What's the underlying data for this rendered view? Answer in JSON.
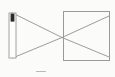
{
  "figure": {
    "background_color": "#fbfbfa",
    "width": 115,
    "height": 77,
    "line_color": "#8a8a8a",
    "box_line_color": "#9a9a9a",
    "object_body_color": "#fdfdfd",
    "object_outline_color": "#8d8d8d",
    "object_tip_color": "#2a2a2a",
    "caption_stub_color": "#b9b9b9"
  },
  "object_source": {
    "name": "candle",
    "x": 9,
    "y": 13,
    "width": 7,
    "height": 45,
    "tip_height": 8,
    "top_point_x": 12.5,
    "top_point_y": 13,
    "bottom_point_x": 12.5,
    "bottom_point_y": 58
  },
  "pinhole": {
    "name": "pinhole aperture",
    "x": 62,
    "y": 37.5
  },
  "screen_box": {
    "name": "image screen box",
    "x": 63.5,
    "y": 11.5,
    "width": 46,
    "height": 49,
    "right_x": 109.5,
    "bottom_y": 60.5,
    "fill": "#ffffff"
  },
  "rays": [
    {
      "name": "ray-top-to-bottom",
      "from_x": 12.5,
      "from_y": 13,
      "through_x": 62,
      "through_y": 37.5,
      "to_x": 109,
      "to_y": 57
    },
    {
      "name": "ray-bottom-to-top",
      "from_x": 12.5,
      "from_y": 58,
      "through_x": 62,
      "through_y": 37.5,
      "to_x": 109,
      "to_y": 16
    }
  ],
  "chart_data": {
    "type": "diagram",
    "elements": [
      {
        "label": "candle (object)",
        "x": 12.5,
        "y": 35.5
      },
      {
        "label": "pinhole",
        "x": 62,
        "y": 37.5
      },
      {
        "label": "screen / image box",
        "x": 86.5,
        "y": 36
      }
    ],
    "annotations": []
  }
}
